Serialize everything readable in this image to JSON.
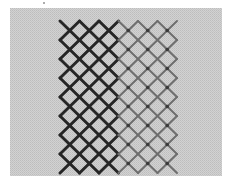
{
  "image": {
    "subject": "embroidery lattice stitch sample on even-weave fabric",
    "colors": {
      "background": "#ffffff",
      "fabric": "#cfcfcf",
      "dark_thread": "#262626",
      "light_thread": "#6e6e6e"
    },
    "fabric_rect": [
      10,
      8,
      212,
      168
    ],
    "lattice": {
      "x_start": 60,
      "y_start": 21,
      "pitch_x": 19.5,
      "pitch_y": 19,
      "columns": 7,
      "rows": 8,
      "dark_columns": 3
    }
  }
}
